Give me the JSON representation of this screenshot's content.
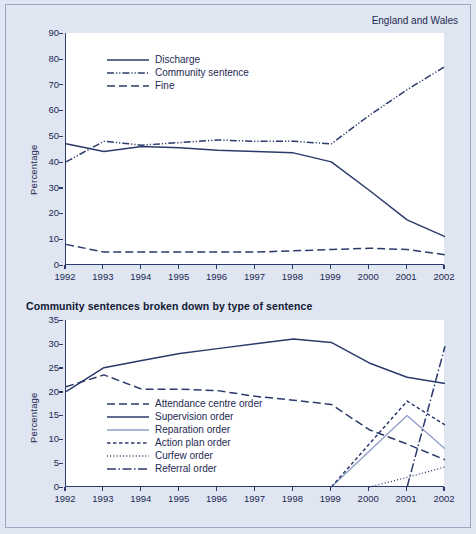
{
  "corner_note": "England and Wales",
  "panel2_title": "Community sentences broken down by type of sentence",
  "colors": {
    "ink": "#2b3a6b",
    "light_line": "#8e9ccb",
    "background": "#dfe5f1",
    "plot_background": "#ffffff"
  },
  "chart_data": [
    {
      "type": "line",
      "title": "",
      "annotation": "England and Wales",
      "xlabel": "",
      "ylabel": "Percentage",
      "x": [
        1992,
        1993,
        1994,
        1995,
        1996,
        1997,
        1998,
        1999,
        2000,
        2001,
        2002
      ],
      "xlim": [
        1992,
        2002
      ],
      "ylim": [
        0,
        90
      ],
      "yticks": [
        0,
        10,
        20,
        30,
        40,
        50,
        60,
        70,
        80,
        90
      ],
      "xticks": [
        "1992",
        "1993",
        "1994",
        "1995",
        "1996",
        "1997",
        "1998",
        "1999",
        "2000",
        "2001",
        "2002"
      ],
      "grid": false,
      "legend_position": "upper-left",
      "series": [
        {
          "name": "Discharge",
          "style": "solid",
          "color": "#2b3a6b",
          "values": [
            47,
            44,
            46,
            45.5,
            44.5,
            44,
            43.5,
            40,
            29,
            17.5,
            11
          ]
        },
        {
          "name": "Community sentence",
          "style": "dash-dot-dot",
          "color": "#2b3a6b",
          "values": [
            40,
            48,
            46.5,
            47.5,
            48.5,
            48,
            48,
            47,
            58,
            68,
            77
          ]
        },
        {
          "name": "Fine",
          "style": "dashed",
          "color": "#2b3a6b",
          "values": [
            8,
            5,
            5,
            5,
            5,
            5,
            5.5,
            6,
            6.5,
            6,
            4
          ]
        }
      ]
    },
    {
      "type": "line",
      "title": "Community sentences broken down by type of sentence",
      "xlabel": "",
      "ylabel": "Percentage",
      "x": [
        1992,
        1993,
        1994,
        1995,
        1996,
        1997,
        1998,
        1999,
        2000,
        2001,
        2002
      ],
      "xlim": [
        1992,
        2002
      ],
      "ylim": [
        0,
        35
      ],
      "yticks": [
        0,
        5,
        10,
        15,
        20,
        25,
        30,
        35
      ],
      "xticks": [
        "1992",
        "1993",
        "1994",
        "1995",
        "1996",
        "1997",
        "1998",
        "1999",
        "2000",
        "2001",
        "2002"
      ],
      "grid": false,
      "legend_position": "center-left",
      "series": [
        {
          "name": "Attendance centre order",
          "style": "dashed",
          "color": "#2b3a6b",
          "values": [
            21,
            23.5,
            20.5,
            20.5,
            20.2,
            19,
            18.2,
            17.3,
            12,
            9,
            5.7
          ]
        },
        {
          "name": "Supervision order",
          "style": "solid",
          "color": "#2b3a6b",
          "values": [
            20,
            25,
            26.5,
            28,
            29,
            30,
            31,
            30.3,
            26,
            23,
            21.7
          ]
        },
        {
          "name": "Reparation order",
          "style": "solid-light",
          "color": "#8e9ccb",
          "values": [
            null,
            null,
            null,
            null,
            null,
            null,
            null,
            0,
            7.5,
            15,
            8
          ]
        },
        {
          "name": "Action plan order",
          "style": "short-dash",
          "color": "#2b3a6b",
          "values": [
            null,
            null,
            null,
            null,
            null,
            null,
            null,
            0,
            9,
            18,
            13
          ]
        },
        {
          "name": "Curfew order",
          "style": "dotted",
          "color": "#2b3a6b",
          "values": [
            null,
            null,
            null,
            null,
            null,
            null,
            null,
            null,
            0,
            2,
            4.2
          ]
        },
        {
          "name": "Referral order",
          "style": "dash-dot",
          "color": "#2b3a6b",
          "values": [
            null,
            null,
            null,
            null,
            null,
            null,
            null,
            null,
            null,
            0,
            29.5
          ]
        }
      ]
    }
  ]
}
